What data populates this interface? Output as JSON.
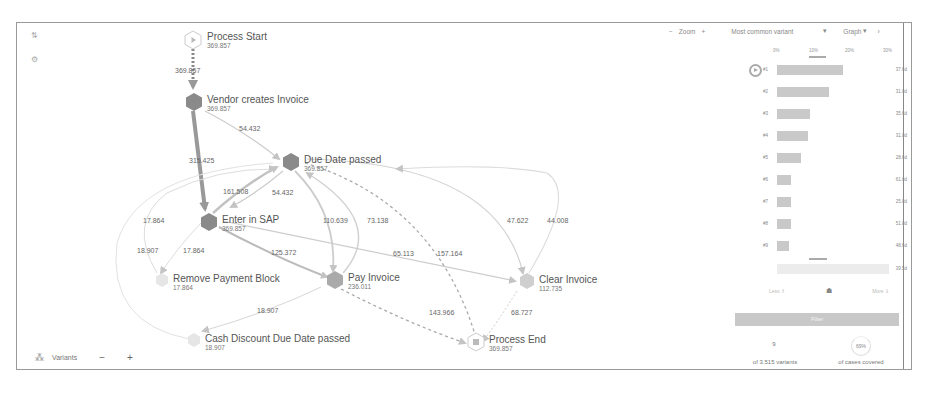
{
  "toolbar": {
    "zoom_minus": "−",
    "zoom_label": "Zoom",
    "zoom_plus": "+",
    "variant_select": "Most common variant",
    "variant_caret": "▾",
    "view_select": "Graph",
    "view_caret": "▾",
    "collapse": "›"
  },
  "left_tools": {
    "tool1_icon": "layout-icon",
    "tool1": "⇅",
    "tool2_icon": "settings-icon",
    "tool2": "⚙"
  },
  "bottom_bar": {
    "variants_icon": "variants-icon",
    "variants_label": "Variants",
    "minus": "−",
    "plus": "+"
  },
  "graph": {
    "nodes": [
      {
        "id": "start",
        "label": "Process Start",
        "count": "369.857"
      },
      {
        "id": "vendor",
        "label": "Vendor creates Invoice",
        "count": "369.857"
      },
      {
        "id": "due",
        "label": "Due Date passed",
        "count": "369.857"
      },
      {
        "id": "sap",
        "label": "Enter in SAP",
        "count": "369.857"
      },
      {
        "id": "remove",
        "label": "Remove Payment Block",
        "count": "17.864"
      },
      {
        "id": "pay",
        "label": "Pay Invoice",
        "count": "236.011"
      },
      {
        "id": "clear",
        "label": "Clear Invoice",
        "count": "112.735"
      },
      {
        "id": "cash",
        "label": "Cash Discount Due Date passed",
        "count": "18.907"
      },
      {
        "id": "end",
        "label": "Process End",
        "count": "369.857"
      }
    ],
    "edges": [
      {
        "from": "start",
        "to": "vendor",
        "label": "369.857"
      },
      {
        "from": "vendor",
        "to": "due",
        "label": "54.432"
      },
      {
        "from": "vendor",
        "to": "sap",
        "label": "315.425"
      },
      {
        "from": "sap",
        "to": "due",
        "label": "161.508"
      },
      {
        "from": "due",
        "to": "sap",
        "label": "54.432"
      },
      {
        "from": "remove",
        "to": "due",
        "label": "17.864"
      },
      {
        "from": "cash",
        "to": "due",
        "label": "18.907"
      },
      {
        "from": "sap",
        "to": "remove",
        "label": "17.864"
      },
      {
        "from": "sap",
        "to": "pay",
        "label": "125.372"
      },
      {
        "from": "due",
        "to": "pay",
        "label": "110.639"
      },
      {
        "from": "pay",
        "to": "due",
        "label": "73.138"
      },
      {
        "from": "sap",
        "to": "clear",
        "label": "65.113"
      },
      {
        "from": "due",
        "to": "end",
        "label": "157.164"
      },
      {
        "from": "due",
        "to": "clear",
        "label": "47.622"
      },
      {
        "from": "clear",
        "to": "due",
        "label": "44.008"
      },
      {
        "from": "pay",
        "to": "cash",
        "label": "18.907"
      },
      {
        "from": "pay",
        "to": "end",
        "label": "143.966"
      },
      {
        "from": "clear",
        "to": "end",
        "label": "68.727"
      }
    ]
  },
  "variants_panel": {
    "axis_ticks": [
      "0%",
      "10%",
      "20%",
      "30%"
    ],
    "rows": [
      {
        "rank": "#1",
        "pct": 24,
        "value": "37.6d"
      },
      {
        "rank": "#2",
        "pct": 19,
        "value": "31.0d"
      },
      {
        "rank": "#3",
        "pct": 12,
        "value": "35.6d"
      },
      {
        "rank": "#4",
        "pct": 11,
        "value": "31.0d"
      },
      {
        "rank": "#5",
        "pct": 9,
        "value": "28.6d"
      },
      {
        "rank": "#6",
        "pct": 5,
        "value": "61.0d"
      },
      {
        "rank": "#7",
        "pct": 5,
        "value": "25.0d"
      },
      {
        "rank": "#8",
        "pct": 5,
        "value": "51.0d"
      },
      {
        "rank": "#9",
        "pct": 5,
        "value": "48.6d"
      },
      {
        "rank": "",
        "pct": 40,
        "value": "39.5d"
      }
    ],
    "less_label": "Less",
    "less_icon": "⇑",
    "more_label": "More",
    "more_icon": "⇓",
    "filter_label": "Filter",
    "variants_count": "9",
    "variants_of": "of 3.515 variants",
    "cases_pct": "69%",
    "cases_label": "of cases covered"
  }
}
